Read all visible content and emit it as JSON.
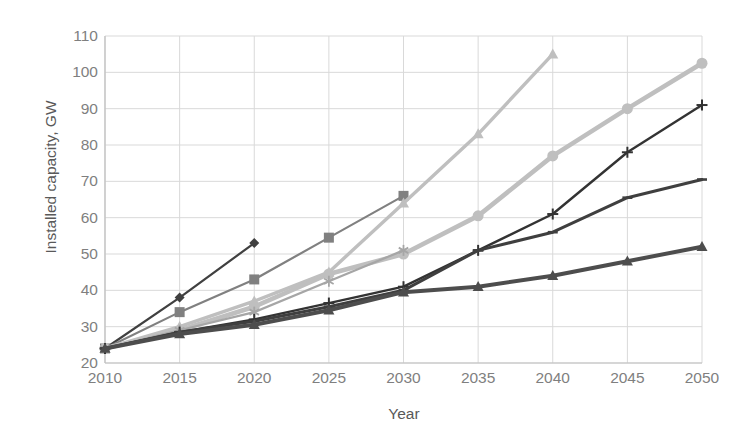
{
  "chart_data": {
    "type": "line",
    "title": "",
    "xlabel": "Year",
    "ylabel": "Installed capacity, GW",
    "x": [
      2010,
      2015,
      2020,
      2025,
      2030,
      2035,
      2040,
      2045,
      2050
    ],
    "xlim": [
      2010,
      2050
    ],
    "ylim": [
      20,
      110
    ],
    "yticks": [
      20,
      30,
      40,
      50,
      60,
      70,
      80,
      90,
      100,
      110
    ],
    "xticks": [
      "2010",
      "2015",
      "2020",
      "2025",
      "2030",
      "2035",
      "2040",
      "2045",
      "2050"
    ],
    "grid": true,
    "legend": "none",
    "series": [
      {
        "name": "series-1-diamond-dark",
        "marker": "diamond",
        "color": "#404040",
        "width": 2.2,
        "x": [
          2010,
          2015,
          2020
        ],
        "values": [
          24,
          38,
          53
        ]
      },
      {
        "name": "series-2-square-gray",
        "marker": "square",
        "color": "#808080",
        "width": 2.2,
        "x": [
          2010,
          2015,
          2020,
          2025,
          2030
        ],
        "values": [
          24,
          34,
          43,
          54.5,
          66
        ]
      },
      {
        "name": "series-3-triangle-light",
        "marker": "triangle",
        "color": "#bfbfbf",
        "width": 3.4,
        "x": [
          2010,
          2015,
          2020,
          2025,
          2030,
          2035,
          2040
        ],
        "values": [
          24,
          30,
          37,
          45,
          64,
          83,
          105
        ]
      },
      {
        "name": "series-4-circle-light",
        "marker": "circle",
        "color": "#bfbfbf",
        "width": 4.6,
        "x": [
          2010,
          2015,
          2020,
          2025,
          2030,
          2035,
          2040,
          2045,
          2050
        ],
        "values": [
          24,
          29,
          35.5,
          44.5,
          50,
          60.5,
          77,
          90,
          102.5
        ]
      },
      {
        "name": "series-5-asterisk-gray",
        "marker": "asterisk",
        "color": "#a6a6a6",
        "width": 2.2,
        "x": [
          2010,
          2015,
          2020,
          2025,
          2030
        ],
        "values": [
          24,
          29,
          34,
          42.5,
          51
        ]
      },
      {
        "name": "series-6-plus-dark",
        "marker": "plus",
        "color": "#333333",
        "width": 2.4,
        "x": [
          2010,
          2015,
          2020,
          2025,
          2030,
          2035,
          2040,
          2045,
          2050
        ],
        "values": [
          24,
          28.5,
          32,
          36.5,
          41,
          51,
          61,
          78,
          91
        ]
      },
      {
        "name": "series-7-dash-dark",
        "marker": "dash",
        "color": "#3f3f3f",
        "width": 3.0,
        "x": [
          2010,
          2015,
          2020,
          2025,
          2030,
          2035,
          2040,
          2045,
          2050
        ],
        "values": [
          24,
          28.5,
          31.5,
          35.5,
          40,
          51,
          56,
          65.5,
          70.5
        ]
      },
      {
        "name": "series-8-triangle-dark",
        "marker": "triangle",
        "color": "#4d4d4d",
        "width": 4.0,
        "x": [
          2010,
          2015,
          2020,
          2025,
          2030,
          2035,
          2040,
          2045,
          2050
        ],
        "values": [
          24,
          28,
          30.5,
          34.5,
          39.5,
          41,
          44,
          48,
          52
        ]
      }
    ],
    "colors": {
      "grid": "#d9d9d9",
      "axis": "#bfbfbf",
      "tick_text": "#7f7f7f",
      "axis_title": "#595959",
      "background": "#ffffff"
    }
  }
}
